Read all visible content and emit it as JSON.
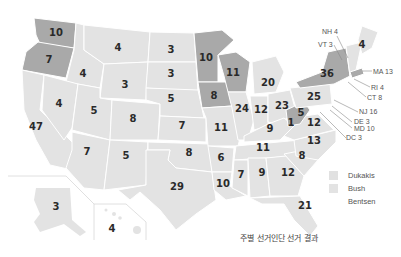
{
  "title": "주별 선거인단 선거 결과",
  "colors": {
    "dukakis": "#a9a9a9",
    "bush": "#e3e3e3",
    "bentsen": "#ffffff"
  },
  "legend": [
    {
      "label": "Dukakis",
      "color": "#a9a9a9"
    },
    {
      "label": "Bush",
      "color": "#e3e3e3"
    },
    {
      "label": "Bentsen",
      "color": "#ffffff"
    }
  ],
  "states": {
    "WA": "10",
    "OR": "7",
    "CA": "47",
    "ID": "4",
    "NV": "4",
    "MT": "4",
    "WY": "3",
    "UT": "5",
    "AZ": "7",
    "CO": "8",
    "NM": "5",
    "ND": "3",
    "SD": "3",
    "NE": "5",
    "KS": "7",
    "OK": "8",
    "TX": "29",
    "MN": "10",
    "IA": "8",
    "MO": "11",
    "AR": "6",
    "LA": "10",
    "WI": "11",
    "IL": "24",
    "MI": "20",
    "IN": "12",
    "OH": "23",
    "KY": "9",
    "TN": "11",
    "MS": "7",
    "AL": "9",
    "GA": "12",
    "FL": "21",
    "SC": "8",
    "NC": "13",
    "VA": "12",
    "WV": "5",
    "WV_extra": "1",
    "PA": "25",
    "NY": "36",
    "ME": "4",
    "AK": "3",
    "HI": "4"
  },
  "callouts": {
    "NH": "NH 4",
    "VT": "VT 3",
    "MA": "MA 13",
    "RI": "RI 4",
    "CT": "CT 8",
    "NJ": "NJ 16",
    "DE": "DE 3",
    "MD": "MD 10",
    "DC": "DC 3"
  }
}
